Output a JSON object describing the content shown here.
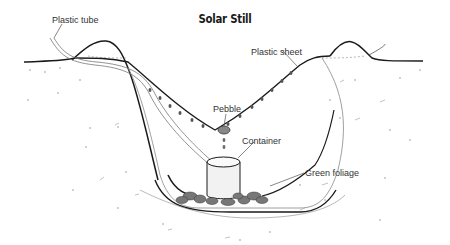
{
  "diagram": {
    "title": "Solar Still",
    "labels": {
      "plastic_tube": "Plastic tube",
      "plastic_sheet": "Plastic sheet",
      "pebble": "Pebble",
      "container": "Container",
      "green_foliage": "Green foliage"
    },
    "colors": {
      "line": "#1a1a1a",
      "leader": "#555555",
      "soil_dots": "#999999",
      "container_fill": "#f2f2f2",
      "foliage": "#555555"
    }
  }
}
